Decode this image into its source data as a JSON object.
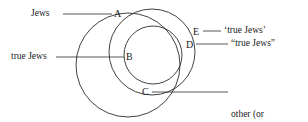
{
  "figure": {
    "type": "venn-diagram",
    "background_color": "#ffffff",
    "stroke_color": "#2b2b2b"
  },
  "circles": [
    {
      "name": "jews-circle",
      "cx": 128,
      "cy": 65,
      "r": 52
    },
    {
      "name": "true-jews-circle",
      "cx": 153,
      "cy": 55,
      "r": 29
    },
    {
      "name": "other-jews-circle",
      "cx": 152,
      "cy": 52,
      "r": 43
    }
  ],
  "point_labels": [
    {
      "id": "A",
      "text": "A",
      "x": 114,
      "y": 8
    },
    {
      "id": "B",
      "text": "B",
      "x": 126,
      "y": 51
    },
    {
      "id": "C",
      "text": "C",
      "x": 142,
      "y": 86
    },
    {
      "id": "D",
      "text": "D",
      "x": 186,
      "y": 39
    },
    {
      "id": "E",
      "text": "E",
      "x": 193,
      "y": 27
    }
  ],
  "side_labels": {
    "jews": "Jews",
    "true_jews": "true Jews",
    "single_quoted_true_jews": "‘true Jews’",
    "double_quoted_true_jews": "“true Jews”",
    "other_jews_line1": "other (or",
    "other_jews_line2": "nominal) Jews"
  },
  "leader_lines": [
    {
      "name": "jews-leader",
      "x1": 63,
      "y1": 14,
      "x2": 112,
      "y2": 14
    },
    {
      "name": "true-jews-leader",
      "x1": 56,
      "y1": 57,
      "x2": 124,
      "y2": 57
    },
    {
      "name": "e-leader",
      "x1": 203,
      "y1": 31,
      "x2": 221,
      "y2": 31
    },
    {
      "name": "d-leader",
      "x1": 196,
      "y1": 44,
      "x2": 228,
      "y2": 44
    },
    {
      "name": "c-leader",
      "x1": 152,
      "y1": 92,
      "x2": 228,
      "y2": 92
    }
  ]
}
